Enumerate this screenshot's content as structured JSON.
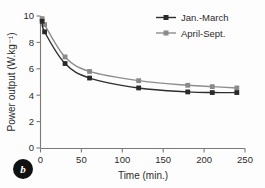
{
  "panel": {
    "letter": "b"
  },
  "chart_data": {
    "type": "line",
    "title": "",
    "xlabel": "Time (min.)",
    "ylabel": "Power output (W.kg⁻¹)",
    "xlim": [
      0,
      250
    ],
    "ylim": [
      0,
      10
    ],
    "xticks": [
      0,
      50,
      100,
      150,
      200,
      250
    ],
    "yticks": [
      0,
      2,
      4,
      6,
      8,
      10
    ],
    "grid": false,
    "legend_position": "top-right",
    "series": [
      {
        "name": "Jan.-March",
        "color": "#2e2e2e",
        "marker": "square",
        "x": [
          2,
          5,
          30,
          60,
          120,
          180,
          210,
          240
        ],
        "values": [
          9.6,
          8.8,
          6.4,
          5.3,
          4.55,
          4.25,
          4.2,
          4.2
        ]
      },
      {
        "name": "April-Sept.",
        "color": "#8d8d8d",
        "marker": "square",
        "x": [
          2,
          5,
          30,
          60,
          120,
          180,
          210,
          240
        ],
        "values": [
          9.8,
          9.35,
          6.9,
          5.8,
          5.1,
          4.75,
          4.65,
          4.55
        ]
      }
    ]
  }
}
